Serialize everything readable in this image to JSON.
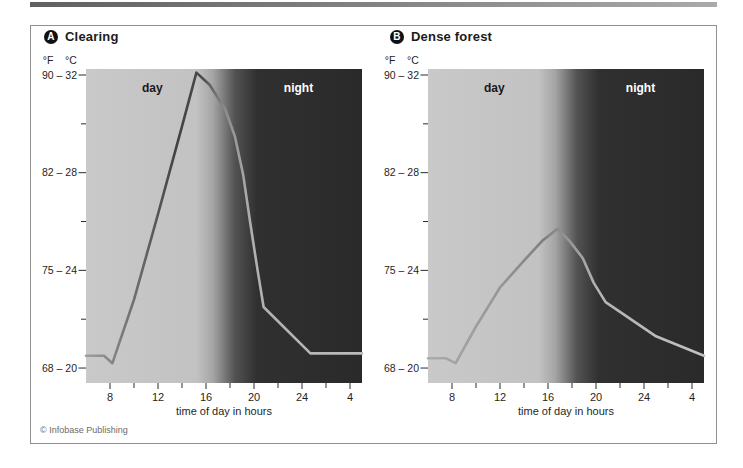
{
  "figure": {
    "copyright": "© Infobase Publishing"
  },
  "chart_data": [
    {
      "type": "line",
      "panel_letter": "A",
      "title": "Clearing",
      "x_axis_title": "time of day in hours",
      "x_range_hours": [
        6,
        29
      ],
      "x_ticks": [
        {
          "hour": 8,
          "label": "8"
        },
        {
          "hour": 12,
          "label": "12"
        },
        {
          "hour": 16,
          "label": "16"
        },
        {
          "hour": 20,
          "label": "20"
        },
        {
          "hour": 24,
          "label": "24"
        },
        {
          "hour": 28,
          "label": "4"
        }
      ],
      "x_minor_tick_hours": [
        10,
        14,
        18,
        22,
        26
      ],
      "y_axis_unit_labels": [
        "°F",
        "°C"
      ],
      "y_ticks": [
        {
          "fahrenheit": 90,
          "celsius": 32,
          "label": "90 – 32"
        },
        {
          "fahrenheit": 82,
          "celsius": 28,
          "label": "82 – 28"
        },
        {
          "fahrenheit": 75,
          "celsius": 24,
          "label": "75 – 24"
        },
        {
          "fahrenheit": 68,
          "celsius": 20,
          "label": "68 – 20"
        }
      ],
      "y_minor_tick_celsius": [
        30,
        26,
        22
      ],
      "y_range_celsius": [
        19.4,
        32.3
      ],
      "zones": {
        "day_label": "day",
        "night_label": "night",
        "transition_hours": [
          15.7,
          20.3
        ]
      },
      "points_hour_celsius": [
        [
          6,
          20.5
        ],
        [
          7.5,
          20.5
        ],
        [
          8.2,
          20.2
        ],
        [
          10,
          22.8
        ],
        [
          12,
          26.3
        ],
        [
          14,
          29.9
        ],
        [
          15.2,
          32.1
        ],
        [
          16.3,
          31.6
        ],
        [
          17.6,
          30.6
        ],
        [
          18.4,
          29.5
        ],
        [
          19.1,
          27.9
        ],
        [
          19.7,
          25.9
        ],
        [
          20.3,
          24.0
        ],
        [
          20.8,
          22.5
        ],
        [
          24.7,
          20.6
        ],
        [
          29,
          20.6
        ]
      ],
      "colors": {
        "bg_gradient_stops": [
          [
            0,
            "#c9c9c9"
          ],
          [
            0.4,
            "#c2c2c2"
          ],
          [
            0.46,
            "#a5a5a5"
          ],
          [
            0.54,
            "#525252"
          ],
          [
            0.62,
            "#303030"
          ],
          [
            1,
            "#2a2a2a"
          ]
        ],
        "line_gradient_stops": [
          [
            0,
            "#9f9f9f"
          ],
          [
            0.15,
            "#757575"
          ],
          [
            0.33,
            "#424242"
          ],
          [
            0.42,
            "#4a4a4a"
          ],
          [
            0.5,
            "#8a8a8a"
          ],
          [
            0.6,
            "#b0b0b0"
          ],
          [
            1,
            "#bcbcbc"
          ]
        ],
        "day_label_color": "#1a1a1a",
        "night_label_color": "#ffffff",
        "tick_color": "#2b2b2b",
        "text_color": "#1f1f1f"
      }
    },
    {
      "type": "line",
      "panel_letter": "B",
      "title": "Dense forest",
      "x_axis_title": "time of day in hours",
      "x_range_hours": [
        6,
        29
      ],
      "x_ticks": [
        {
          "hour": 8,
          "label": "8"
        },
        {
          "hour": 12,
          "label": "12"
        },
        {
          "hour": 16,
          "label": "16"
        },
        {
          "hour": 20,
          "label": "20"
        },
        {
          "hour": 24,
          "label": "24"
        },
        {
          "hour": 28,
          "label": "4"
        }
      ],
      "x_minor_tick_hours": [
        10,
        14,
        18,
        22,
        26
      ],
      "y_axis_unit_labels": [
        "°F",
        "°C"
      ],
      "y_ticks": [
        {
          "fahrenheit": 90,
          "celsius": 32,
          "label": "90 – 32"
        },
        {
          "fahrenheit": 82,
          "celsius": 28,
          "label": "82 – 28"
        },
        {
          "fahrenheit": 75,
          "celsius": 24,
          "label": "75 – 24"
        },
        {
          "fahrenheit": 68,
          "celsius": 20,
          "label": "68 – 20"
        }
      ],
      "y_minor_tick_celsius": [
        30,
        26,
        22
      ],
      "y_range_celsius": [
        19.4,
        32.3
      ],
      "zones": {
        "day_label": "day",
        "night_label": "night",
        "transition_hours": [
          15.7,
          20.3
        ]
      },
      "points_hour_celsius": [
        [
          6,
          20.4
        ],
        [
          7.5,
          20.4
        ],
        [
          8.3,
          20.2
        ],
        [
          10,
          21.7
        ],
        [
          12,
          23.3
        ],
        [
          14,
          24.4
        ],
        [
          15.5,
          25.2
        ],
        [
          16.8,
          25.7
        ],
        [
          17.8,
          25.2
        ],
        [
          18.9,
          24.5
        ],
        [
          19.8,
          23.5
        ],
        [
          20.8,
          22.7
        ],
        [
          22,
          22.3
        ],
        [
          25,
          21.3
        ],
        [
          29,
          20.5
        ]
      ],
      "colors": {
        "bg_gradient_stops": [
          [
            0,
            "#c9c9c9"
          ],
          [
            0.4,
            "#c2c2c2"
          ],
          [
            0.46,
            "#a5a5a5"
          ],
          [
            0.54,
            "#525252"
          ],
          [
            0.62,
            "#303030"
          ],
          [
            1,
            "#2a2a2a"
          ]
        ],
        "line_gradient_stops": [
          [
            0,
            "#ababab"
          ],
          [
            0.25,
            "#979797"
          ],
          [
            0.42,
            "#7e7e7e"
          ],
          [
            0.52,
            "#9a9a9a"
          ],
          [
            0.62,
            "#b4b4b4"
          ],
          [
            1,
            "#c2c2c2"
          ]
        ],
        "day_label_color": "#1a1a1a",
        "night_label_color": "#ffffff",
        "tick_color": "#2b2b2b",
        "text_color": "#1f1f1f"
      }
    }
  ]
}
